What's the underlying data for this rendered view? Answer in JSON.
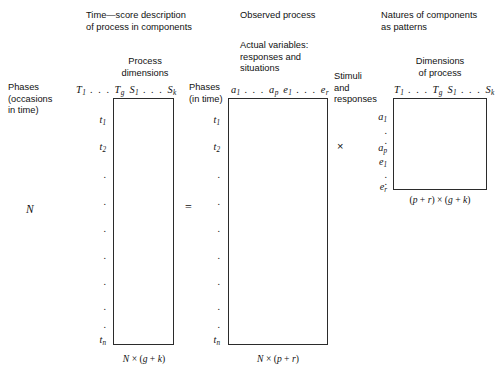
{
  "figure": {
    "panels": [
      {
        "id": "left",
        "title": "Time—score description\nof process in components",
        "column_group_label": "Process\ndimensions",
        "row_axis_label": "Phases\n(occasions\nin time)",
        "column_headers": [
          "T",
          "g",
          "S",
          "k"
        ],
        "column_header_text": "T1 . . . Tg  S1 . . . Sk",
        "row_labels": [
          "t1",
          "t2",
          "tn"
        ],
        "row_dots_count": 7,
        "outer_label": "N",
        "dimension_label": "N × (g + k)"
      },
      {
        "id": "middle",
        "title": "Observed process",
        "column_group_label": "Actual variables:\nresponses and\nsituations",
        "row_axis_label": "Phases\n(in time)",
        "column_header_text": "a1 . . . ap  e1 . . . er",
        "row_labels": [
          "t1",
          "t2",
          "tn"
        ],
        "row_dots_count": 7,
        "dimension_label": "N × (p + r)"
      },
      {
        "id": "right",
        "title": "Natures of components\nas patterns",
        "column_group_label": "Dimensions\nof process",
        "row_axis_label": "Stimuli\nand\nresponses",
        "column_header_text": "T1 . . . Tg  S1 . . . Sk",
        "row_labels": [
          "a1",
          "ap",
          "e1",
          "er"
        ],
        "dimension_label": "(p + r) × (g + k)"
      }
    ],
    "operators": {
      "equals": "=",
      "times": "×"
    },
    "colors": {
      "box_stroke": "#2b2b2b",
      "text": "#111111",
      "background": "#ffffff"
    }
  }
}
